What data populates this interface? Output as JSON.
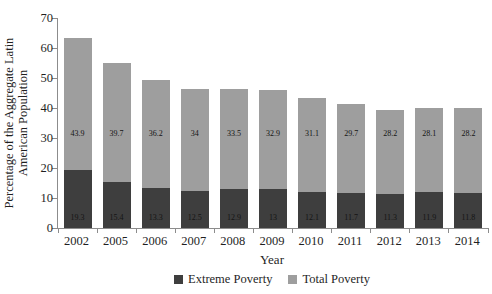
{
  "chart_data": {
    "type": "bar",
    "stacked": true,
    "title": "",
    "xlabel": "Year",
    "ylabel": "Percentage of the Aggregate Latin American Population",
    "ylabel_lines": [
      "Percentage of the Aggregate Latin",
      "American Population"
    ],
    "ylim": [
      0,
      70
    ],
    "yticks": [
      0,
      10,
      20,
      30,
      40,
      50,
      60,
      70
    ],
    "grid": false,
    "legend_position": "bottom",
    "categories": [
      "2002",
      "2005",
      "2006",
      "2007",
      "2008",
      "2009",
      "2010",
      "2011",
      "2012",
      "2013",
      "2014"
    ],
    "series": [
      {
        "name": "Extreme Poverty",
        "color": "#3e3e3e",
        "values": [
          19.3,
          15.4,
          13.3,
          12.5,
          12.9,
          13,
          12.1,
          11.7,
          11.3,
          11.9,
          11.8
        ]
      },
      {
        "name": "Total Poverty",
        "color": "#9e9e9e",
        "values": [
          43.9,
          39.7,
          36.2,
          34,
          33.5,
          32.9,
          31.1,
          29.7,
          28.2,
          28.1,
          28.2
        ]
      }
    ]
  }
}
